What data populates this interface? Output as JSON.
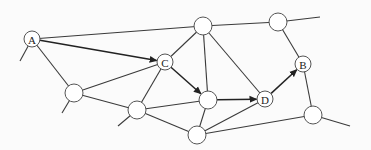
{
  "diagram": {
    "type": "network-graph",
    "background": "#fbfbfb",
    "edge_color": "#3a3a3a",
    "arrow_color": "#222222",
    "nodes": [
      {
        "id": "A",
        "label": "A",
        "x": 32,
        "y": 39,
        "r": 8
      },
      {
        "id": "T1",
        "label": "",
        "x": 203,
        "y": 26,
        "r": 9
      },
      {
        "id": "T2",
        "label": "",
        "x": 278,
        "y": 22,
        "r": 9
      },
      {
        "id": "C",
        "label": "C",
        "x": 165,
        "y": 62,
        "r": 8
      },
      {
        "id": "B",
        "label": "B",
        "x": 303,
        "y": 64,
        "r": 8
      },
      {
        "id": "M",
        "label": "",
        "x": 208,
        "y": 100,
        "r": 9
      },
      {
        "id": "D",
        "label": "D",
        "x": 265,
        "y": 99,
        "r": 8
      },
      {
        "id": "L",
        "label": "",
        "x": 74,
        "y": 93,
        "r": 9
      },
      {
        "id": "LL",
        "label": "",
        "x": 137,
        "y": 110,
        "r": 9
      },
      {
        "id": "BT",
        "label": "",
        "x": 197,
        "y": 135,
        "r": 9
      },
      {
        "id": "R",
        "label": "",
        "x": 313,
        "y": 115,
        "r": 9
      }
    ],
    "edges": [
      {
        "from": "A",
        "to": "T1",
        "directed": false
      },
      {
        "from": "A",
        "to": "C",
        "directed": true
      },
      {
        "from": "A",
        "to": "L",
        "directed": false
      },
      {
        "from": "T1",
        "to": "T2",
        "directed": false
      },
      {
        "from": "T1",
        "to": "C",
        "directed": false
      },
      {
        "from": "T1",
        "to": "M",
        "directed": false
      },
      {
        "from": "T1",
        "to": "D",
        "directed": false
      },
      {
        "from": "C",
        "to": "L",
        "directed": false
      },
      {
        "from": "C",
        "to": "LL",
        "directed": false
      },
      {
        "from": "C",
        "to": "M",
        "directed": true
      },
      {
        "from": "T2",
        "to": "B",
        "directed": false
      },
      {
        "from": "B",
        "to": "R",
        "directed": false
      },
      {
        "from": "D",
        "to": "B",
        "directed": true
      },
      {
        "from": "M",
        "to": "D",
        "directed": true
      },
      {
        "from": "L",
        "to": "LL",
        "directed": false
      },
      {
        "from": "LL",
        "to": "M",
        "directed": false
      },
      {
        "from": "LL",
        "to": "BT",
        "directed": false
      },
      {
        "from": "M",
        "to": "BT",
        "directed": false
      },
      {
        "from": "BT",
        "to": "D",
        "directed": false
      },
      {
        "from": "BT",
        "to": "R",
        "directed": false
      }
    ],
    "stubs": [
      {
        "from": "A",
        "x2": 20,
        "y2": 61
      },
      {
        "from": "L",
        "x2": 62,
        "y2": 113
      },
      {
        "from": "LL",
        "x2": 118,
        "y2": 126
      },
      {
        "from": "T2",
        "x2": 320,
        "y2": 17
      },
      {
        "from": "R",
        "x2": 350,
        "y2": 126
      }
    ],
    "highlighted_path": [
      "A",
      "C",
      "M",
      "D",
      "B"
    ]
  }
}
